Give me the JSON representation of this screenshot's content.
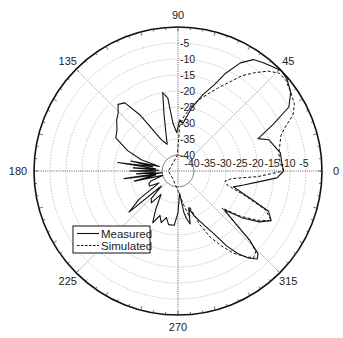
{
  "chart_data": {
    "type": "polar-line",
    "title": "",
    "center_px": [
      178,
      171
    ],
    "outer_radius_px": 144,
    "radial_range_db": [
      -45,
      0
    ],
    "radial_ticks": [
      -40,
      -35,
      -30,
      -25,
      -20,
      -15,
      -10,
      -5
    ],
    "radial_tick_labels": [
      "-40",
      "-35",
      "-30",
      "-25",
      "-20",
      "-15",
      "-10",
      "-5"
    ],
    "angle_labels": [
      {
        "angle": 0,
        "label": "0"
      },
      {
        "angle": 45,
        "label": "45"
      },
      {
        "angle": 90,
        "label": "90"
      },
      {
        "angle": 135,
        "label": "135"
      },
      {
        "angle": 180,
        "label": "180"
      },
      {
        "angle": 225,
        "label": "225"
      },
      {
        "angle": 270,
        "label": "270"
      },
      {
        "angle": 315,
        "label": "315"
      }
    ],
    "grid": true,
    "legend": {
      "position": "lower-left",
      "entries": [
        "Measured",
        "Simulated"
      ]
    },
    "series": [
      {
        "name": "Measured",
        "style": "solid",
        "points": [
          [
            0,
            -12
          ],
          [
            5,
            -12.5
          ],
          [
            10,
            -12.5
          ],
          [
            15,
            -14
          ],
          [
            19,
            -15
          ],
          [
            22,
            -18
          ],
          [
            26,
            -12
          ],
          [
            30,
            -5
          ],
          [
            35,
            -2
          ],
          [
            40,
            -0.5
          ],
          [
            44,
            0
          ],
          [
            48,
            -1
          ],
          [
            52,
            -2
          ],
          [
            56,
            -3
          ],
          [
            60,
            -6
          ],
          [
            64,
            -11
          ],
          [
            67,
            -15.5
          ],
          [
            72,
            -20
          ],
          [
            78,
            -25
          ],
          [
            84,
            -30
          ],
          [
            88,
            -29
          ],
          [
            92,
            -33
          ],
          [
            96,
            -30
          ],
          [
            98,
            -22
          ],
          [
            101,
            -20
          ],
          [
            104,
            -27
          ],
          [
            108,
            -33
          ],
          [
            112,
            -36
          ],
          [
            118,
            -34
          ],
          [
            124,
            -24
          ],
          [
            128,
            -18
          ],
          [
            132,
            -17
          ],
          [
            136,
            -19
          ],
          [
            140,
            -20
          ],
          [
            146,
            -22
          ],
          [
            152,
            -23
          ],
          [
            158,
            -28
          ],
          [
            163,
            -33
          ],
          [
            166,
            -39
          ],
          [
            168,
            -30
          ],
          [
            170,
            -37
          ],
          [
            172,
            -26
          ],
          [
            174,
            -38
          ],
          [
            176,
            -31
          ],
          [
            178,
            -39
          ],
          [
            180,
            -30
          ],
          [
            182,
            -38
          ],
          [
            184,
            -32
          ],
          [
            186,
            -40
          ],
          [
            188,
            -28
          ],
          [
            190,
            -38
          ],
          [
            193,
            -31
          ],
          [
            196,
            -40
          ],
          [
            200,
            -36
          ],
          [
            204,
            -35
          ],
          [
            208,
            -35
          ],
          [
            212,
            -38
          ],
          [
            216,
            -30
          ],
          [
            220,
            -25
          ],
          [
            222,
            -38
          ],
          [
            226,
            -33
          ],
          [
            230,
            -32
          ],
          [
            234,
            -36
          ],
          [
            240,
            -31
          ],
          [
            244,
            -27
          ],
          [
            248,
            -30
          ],
          [
            252,
            -28
          ],
          [
            256,
            -30
          ],
          [
            260,
            -28
          ],
          [
            266,
            -28
          ],
          [
            270,
            -32
          ],
          [
            274,
            -38
          ],
          [
            278,
            -32
          ],
          [
            280,
            -30
          ],
          [
            283,
            -28
          ],
          [
            286,
            -33
          ],
          [
            290,
            -30
          ],
          [
            296,
            -26
          ],
          [
            300,
            -22
          ],
          [
            303,
            -17
          ],
          [
            306,
            -13
          ],
          [
            309,
            -10
          ],
          [
            312,
            -8
          ],
          [
            314,
            -9
          ],
          [
            316,
            -14
          ],
          [
            318,
            -22
          ],
          [
            320,
            -26
          ],
          [
            324,
            -20
          ],
          [
            328,
            -15
          ],
          [
            332,
            -12
          ],
          [
            336,
            -14
          ],
          [
            340,
            -22
          ],
          [
            344,
            -27
          ],
          [
            348,
            -24
          ],
          [
            352,
            -20
          ],
          [
            356,
            -14
          ],
          [
            360,
            -12
          ]
        ]
      },
      {
        "name": "Simulated",
        "style": "dashed",
        "points": [
          [
            0,
            -12
          ],
          [
            5,
            -13
          ],
          [
            10,
            -13
          ],
          [
            15,
            -12
          ],
          [
            19,
            -11
          ],
          [
            22,
            -9
          ],
          [
            26,
            -5
          ],
          [
            30,
            -3
          ],
          [
            35,
            -2
          ],
          [
            40,
            -1
          ],
          [
            44,
            -1
          ],
          [
            48,
            -3
          ],
          [
            52,
            -6
          ],
          [
            56,
            -9
          ],
          [
            60,
            -13
          ],
          [
            64,
            -16
          ],
          [
            67,
            -18
          ],
          [
            72,
            -21
          ],
          [
            78,
            -24
          ],
          [
            84,
            -28
          ],
          [
            88,
            -31
          ],
          [
            92,
            -40
          ],
          [
            120,
            -42
          ],
          [
            180,
            -42
          ],
          [
            240,
            -42
          ],
          [
            280,
            -34
          ],
          [
            284,
            -30
          ],
          [
            288,
            -33
          ],
          [
            292,
            -27
          ],
          [
            296,
            -22
          ],
          [
            300,
            -18
          ],
          [
            304,
            -14
          ],
          [
            308,
            -11
          ],
          [
            311,
            -9
          ],
          [
            314,
            -10
          ],
          [
            316,
            -14
          ],
          [
            318,
            -22
          ],
          [
            320,
            -27
          ],
          [
            324,
            -21
          ],
          [
            328,
            -16
          ],
          [
            332,
            -12
          ],
          [
            336,
            -15
          ],
          [
            340,
            -23
          ],
          [
            344,
            -29
          ],
          [
            348,
            -30
          ],
          [
            352,
            -28
          ],
          [
            356,
            -20
          ],
          [
            360,
            -12
          ]
        ]
      }
    ]
  }
}
